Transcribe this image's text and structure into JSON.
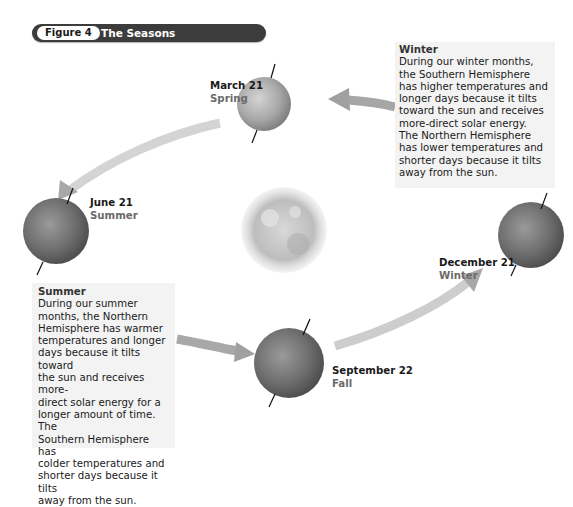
{
  "figure": {
    "number_label": "Figure 4",
    "title": "The Seasons"
  },
  "positions": [
    {
      "id": "march",
      "date": "March 21",
      "season": "Spring"
    },
    {
      "id": "june",
      "date": "June 21",
      "season": "Summer"
    },
    {
      "id": "september",
      "date": "September 22",
      "season": "Fall"
    },
    {
      "id": "december",
      "date": "December 21",
      "season": "Winter"
    }
  ],
  "info_boxes": {
    "winter": {
      "title": "Winter",
      "lines": [
        "During our winter months,",
        "the Southern Hemisphere",
        "has higher temperatures and",
        "longer days because it tilts",
        "toward the sun and receives",
        "more-direct solar energy.",
        "The Northern Hemisphere",
        "has lower temperatures and",
        "shorter days because it tilts",
        "away from the sun."
      ]
    },
    "summer": {
      "title": "Summer",
      "lines": [
        "During our summer",
        "months, the Northern",
        "Hemisphere has warmer",
        "temperatures and longer",
        "days because it tilts toward",
        "the sun and receives more-",
        "direct solar energy for a",
        "longer amount of time. The",
        "Southern Hemisphere has",
        "colder temperatures and",
        "shorter days because it tilts",
        "away from the sun."
      ]
    }
  },
  "colors": {
    "header_bar": "#3c3c3c",
    "arrow": "#a8a8a8",
    "earth": "#6e6e6e",
    "sun": "#c8c8c8",
    "box_bg": "#f3f3f3",
    "season_text": "#6a6a6a"
  }
}
